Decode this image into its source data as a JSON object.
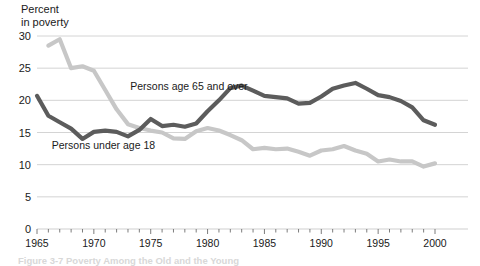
{
  "figure": {
    "axis_title_lines": "Percent\nin poverty",
    "caption": "Figure 3-7  Poverty Among the Old and the Young"
  },
  "chart_data": {
    "type": "line",
    "title": "Percent in poverty",
    "xlabel": "",
    "ylabel": "Percent in poverty",
    "xlim": [
      1965,
      2000
    ],
    "ylim": [
      0,
      30
    ],
    "grid": true,
    "legend_position": "inline-annotations",
    "ytick_labels": [
      "0",
      "5",
      "10",
      "15",
      "20",
      "25",
      "30"
    ],
    "ytick_values": [
      0,
      5,
      10,
      15,
      20,
      25,
      30
    ],
    "xtick_labels": [
      "1965",
      "1970",
      "1975",
      "1980",
      "1985",
      "1990",
      "1995",
      "2000"
    ],
    "xtick_values": [
      1965,
      1970,
      1975,
      1980,
      1985,
      1990,
      1995,
      2000
    ],
    "x": [
      1965,
      1966,
      1967,
      1968,
      1969,
      1970,
      1971,
      1972,
      1973,
      1974,
      1975,
      1976,
      1977,
      1978,
      1979,
      1980,
      1981,
      1982,
      1983,
      1984,
      1985,
      1986,
      1987,
      1988,
      1989,
      1990,
      1991,
      1992,
      1993,
      1994,
      1995,
      1996,
      1997,
      1998,
      1999,
      2000
    ],
    "series": [
      {
        "name": "Persons age 65 and over",
        "color": "#c7c7c7",
        "label_x": 1973.2,
        "label_y": 21.6,
        "values": [
          null,
          28.5,
          29.5,
          25.0,
          25.3,
          24.6,
          21.6,
          18.6,
          16.3,
          15.7,
          15.3,
          15.0,
          14.1,
          14.0,
          15.2,
          15.7,
          15.3,
          14.6,
          13.8,
          12.4,
          12.6,
          12.4,
          12.5,
          12.0,
          11.4,
          12.2,
          12.4,
          12.9,
          12.2,
          11.7,
          10.5,
          10.8,
          10.5,
          10.5,
          9.7,
          10.2
        ]
      },
      {
        "name": "Persons under age 18",
        "color": "#5c5c5c",
        "label_x": 1966.3,
        "label_y": 12.4,
        "values": [
          20.7,
          17.6,
          16.6,
          15.6,
          14.0,
          15.1,
          15.3,
          15.1,
          14.4,
          15.4,
          17.1,
          16.0,
          16.2,
          15.9,
          16.4,
          18.3,
          20.0,
          21.9,
          22.3,
          21.5,
          20.7,
          20.5,
          20.3,
          19.5,
          19.6,
          20.6,
          21.8,
          22.3,
          22.7,
          21.8,
          20.8,
          20.5,
          19.9,
          18.9,
          16.9,
          16.2
        ]
      }
    ]
  }
}
